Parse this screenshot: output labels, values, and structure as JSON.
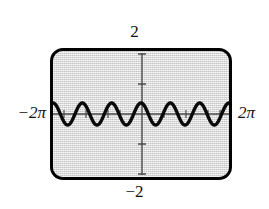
{
  "figure": {
    "kind": "graphing-calculator-screen",
    "background_color": "#e2e2e2",
    "frame_color": "#000000",
    "curve_color": "#000000",
    "axis_color": "#4a4a4a"
  },
  "labels": {
    "y_max": "2",
    "y_min": "−2",
    "x_min": "−2π",
    "x_max": "2π"
  },
  "chart_data": {
    "type": "line",
    "title": "",
    "subtitle": "",
    "xlabel": "",
    "ylabel": "",
    "grid": false,
    "legend": null,
    "function": "y = cos(3x)",
    "amplitude": 0.35,
    "period": 2.0944,
    "cycles_in_window": 6,
    "xlim": [
      -6.2832,
      6.2832
    ],
    "ylim": [
      -2,
      2
    ],
    "xtick_labels": [
      "−2π",
      "2π"
    ],
    "ytick_labels": [
      "2",
      "−2"
    ],
    "x_tick_spacing": 1.5708,
    "y_tick_spacing": 1,
    "x": [
      -6.2832,
      -6.0832,
      -5.8832,
      -5.6832,
      -5.4832,
      -5.2832,
      -5.0832,
      -4.8832,
      -4.6832,
      -4.4832,
      -4.2832,
      -4.0832,
      -3.8832,
      -3.6832,
      -3.4832,
      -3.2832,
      -3.0832,
      -2.8832,
      -2.6832,
      -2.4832,
      -2.2832,
      -2.0832,
      -1.8832,
      -1.6832,
      -1.4832,
      -1.2832,
      -1.0832,
      -0.8832,
      -0.6832,
      -0.4832,
      -0.2832,
      -0.0832,
      0.1168,
      0.3168,
      0.5168,
      0.7168,
      0.9168,
      1.1168,
      1.3168,
      1.5168,
      1.7168,
      1.9168,
      2.1168,
      2.3168,
      2.5168,
      2.7168,
      2.9168,
      3.1168,
      3.3168,
      3.5168,
      3.7168,
      3.9168,
      4.1168,
      4.3168,
      4.5168,
      4.7168,
      4.9168,
      5.1168,
      5.3168,
      5.5168,
      5.7168,
      5.9168,
      6.1168,
      6.2832
    ],
    "y": [
      0.35,
      0.3,
      0.16,
      -0.02,
      -0.2,
      -0.32,
      -0.35,
      -0.28,
      -0.13,
      0.06,
      0.23,
      0.33,
      0.35,
      0.26,
      0.1,
      -0.09,
      -0.25,
      -0.34,
      -0.34,
      -0.24,
      -0.07,
      0.12,
      0.28,
      0.35,
      0.32,
      0.21,
      0.04,
      -0.15,
      -0.29,
      -0.35,
      -0.3,
      -0.18,
      0.0,
      0.18,
      0.3,
      0.35,
      0.29,
      0.15,
      -0.04,
      -0.21,
      -0.32,
      -0.35,
      -0.28,
      -0.12,
      0.07,
      0.24,
      0.34,
      0.34,
      0.25,
      0.09,
      -0.1,
      -0.26,
      -0.35,
      -0.33,
      -0.23,
      -0.06,
      0.13,
      0.29,
      0.35,
      0.31,
      0.2,
      0.02,
      -0.16,
      -0.35
    ]
  }
}
